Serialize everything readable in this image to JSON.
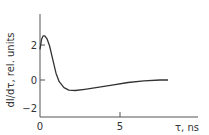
{
  "chart_data": {
    "type": "line",
    "title": "",
    "xlabel": "τ, ns",
    "ylabel": "dI/dτ, rel. units",
    "xlim": [
      0,
      10
    ],
    "ylim": [
      -2.5,
      4
    ],
    "xticks": [
      {
        "value": 0,
        "label": "0"
      },
      {
        "value": 5,
        "label": "5"
      }
    ],
    "yticks": [
      {
        "value": 2,
        "label": "2"
      },
      {
        "value": 0,
        "label": "0"
      },
      {
        "value": -2,
        "label": "−2"
      }
    ],
    "grid": false,
    "series": [
      {
        "name": "dI/dτ",
        "color": "#333333",
        "x": [
          0,
          0.1,
          0.2,
          0.3,
          0.45,
          0.6,
          0.8,
          1.0,
          1.2,
          1.5,
          1.8,
          2.2,
          2.8,
          3.5,
          4.5,
          5.5,
          6.5,
          7.5,
          8.0
        ],
        "y": [
          1.8,
          2.4,
          2.6,
          2.6,
          2.4,
          2.0,
          1.2,
          0.4,
          -0.1,
          -0.45,
          -0.6,
          -0.62,
          -0.55,
          -0.45,
          -0.3,
          -0.15,
          -0.05,
          0.0,
          0.0
        ]
      }
    ]
  }
}
